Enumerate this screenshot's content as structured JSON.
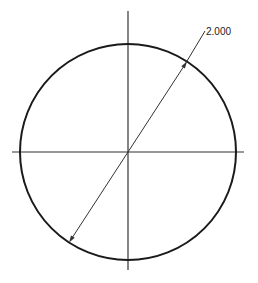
{
  "drawing": {
    "type": "circle-with-diameter-dimension",
    "colors": {
      "background": "#ffffff",
      "circle": "#1a1a1a",
      "centerlines": "#333333",
      "dimension": "#333333"
    },
    "circle": {
      "cx": 128,
      "cy": 152,
      "r": 108
    },
    "centerlines": {
      "horizontal": {
        "x1": 12,
        "y1": 152,
        "x2": 244,
        "y2": 152
      },
      "vertical": {
        "x1": 128,
        "y1": 11,
        "x2": 128,
        "y2": 270
      }
    },
    "dimension": {
      "kind": "diameter",
      "value_label": "2.000",
      "line": {
        "x1": 72,
        "y1": 238,
        "x2": 184,
        "y2": 66
      },
      "leader": {
        "x1": 184,
        "y1": 66,
        "x2": 205,
        "y2": 31
      },
      "text_position": {
        "x": 206,
        "y": 35
      }
    }
  }
}
